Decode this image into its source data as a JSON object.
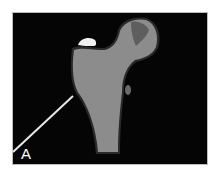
{
  "figure": {
    "label": "A",
    "colors": {
      "background": "#050505",
      "bone": "#8c8c8c",
      "bone_outline": "#2a2a2a",
      "head_region": "#5e5e5e",
      "highlight": "#f2f2f2",
      "pointer_line": "#e8e8e8",
      "label_text": "#ffffff",
      "page": "#ffffff"
    }
  }
}
